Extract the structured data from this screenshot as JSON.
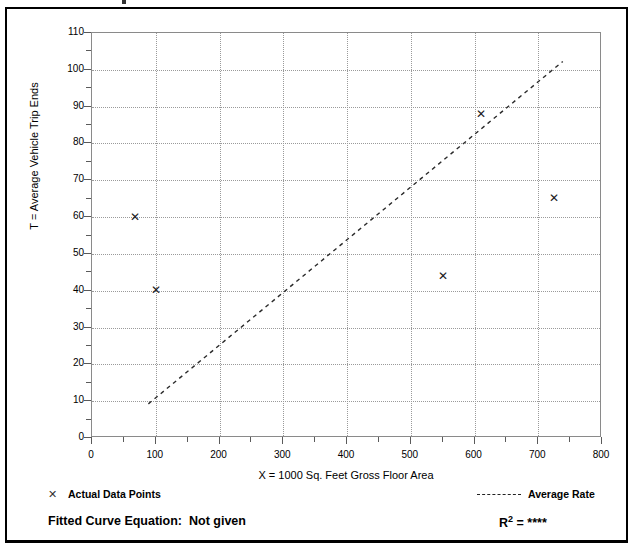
{
  "chart_data": {
    "type": "scatter",
    "title": "",
    "xlabel": "X = 1000 Sq. Feet Gross Floor Area",
    "ylabel": "T = Average Vehicle Trip Ends",
    "xlim": [
      0,
      800
    ],
    "ylim": [
      0,
      110
    ],
    "xticks": [
      0,
      100,
      200,
      300,
      400,
      500,
      600,
      700,
      800
    ],
    "yticks": [
      0,
      10,
      20,
      30,
      40,
      50,
      60,
      70,
      80,
      90,
      100,
      110
    ],
    "xtick_labels": [
      "0",
      "100",
      "200",
      "300",
      "400",
      "500",
      "600",
      "700",
      "800"
    ],
    "ytick_labels": [
      "0",
      "10",
      "20",
      "30",
      "40",
      "50",
      "60",
      "70",
      "80",
      "90",
      "100",
      "110"
    ],
    "grid": true,
    "legend_position": "below-plot",
    "series": [
      {
        "name": "Actual Data Points",
        "type": "scatter",
        "marker": "x",
        "points": [
          {
            "x": 67,
            "y": 60
          },
          {
            "x": 100,
            "y": 40
          },
          {
            "x": 550,
            "y": 44
          },
          {
            "x": 610,
            "y": 88
          },
          {
            "x": 725,
            "y": 65
          }
        ]
      },
      {
        "name": "Average Rate",
        "type": "line",
        "style": "dashed",
        "endpoints": [
          {
            "x": 90,
            "y": 9
          },
          {
            "x": 740,
            "y": 102
          }
        ]
      }
    ]
  },
  "legend": {
    "marker_glyph": "✕",
    "data_points_label": "Actual Data Points",
    "average_rate_label": "Average Rate"
  },
  "footer": {
    "fitted_curve_text": "Fitted Curve Equation:  Not given",
    "r2_prefix": "R",
    "r2_exponent": "2",
    "r2_value": "= ****"
  },
  "colors": {
    "frame": "#000000",
    "grid": "#9a9a9a",
    "axis": "#5a5a5a",
    "marker": "#1a1a1a",
    "trendline": "#2a2a2a",
    "background": "#ffffff"
  }
}
